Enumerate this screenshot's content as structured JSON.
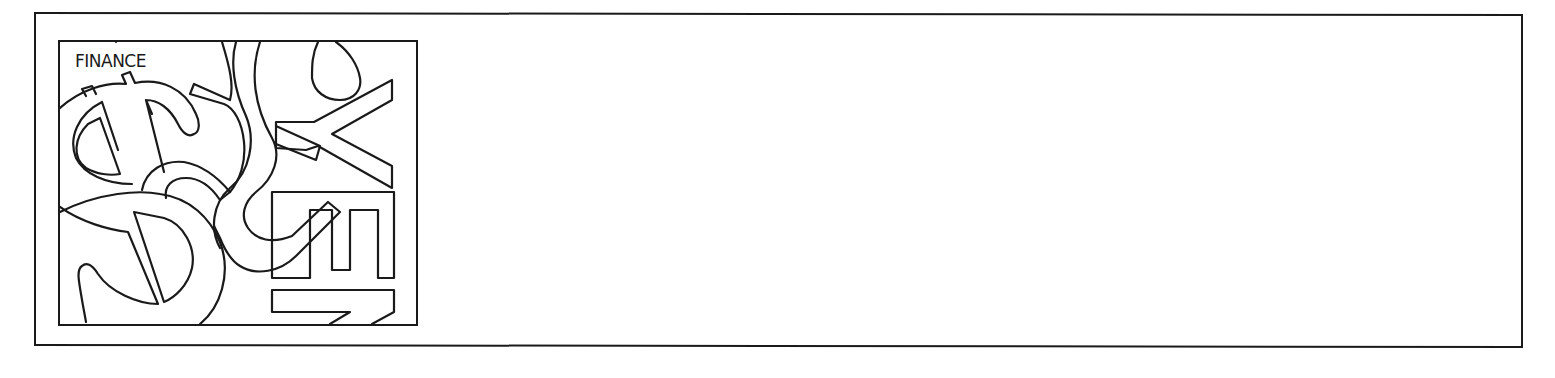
{
  "frame": {
    "border_color": "#1a1a1a",
    "background": "#ffffff"
  },
  "clipart": {
    "label": "FINANCE",
    "subject": "currency symbols illustration",
    "symbols": [
      {
        "name": "dollar-sign",
        "description": "large outlined dollar sign, lower left"
      },
      {
        "name": "dollar-sign",
        "description": "outlined dollar sign, upper left"
      },
      {
        "name": "yen-sign",
        "description": "outlined yen sign rotated sideways, right"
      },
      {
        "name": "pound-sign",
        "description": "outlined curved pound/cent stroke, center"
      },
      {
        "name": "euro-like-bars",
        "description": "outlined stacked bars, lower right"
      }
    ],
    "line_color": "#1a1a1a"
  },
  "content_area": {
    "text": ""
  }
}
